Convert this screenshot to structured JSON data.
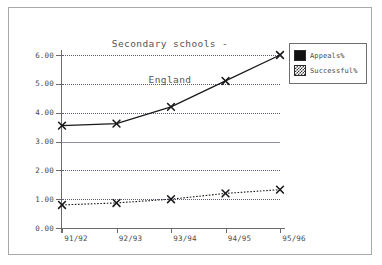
{
  "chart_data": {
    "type": "line",
    "title": "Secondary schools -\nEngland",
    "title_lines": [
      "Secondary schools -",
      "England"
    ],
    "xlabel": "",
    "ylabel": "",
    "categories": [
      "91/92",
      "92/93",
      "93/94",
      "94/95",
      "95/96"
    ],
    "series": [
      {
        "name": "Appeals%",
        "values": [
          3.55,
          3.62,
          4.2,
          5.1,
          6.0
        ],
        "marker": "x",
        "line_style": "solid",
        "color": "#1a1a1a"
      },
      {
        "name": "Successful%",
        "values": [
          0.8,
          0.87,
          1.0,
          1.2,
          1.33
        ],
        "marker": "x",
        "line_style": "dotted",
        "color": "#1a1a1a"
      }
    ],
    "ylim": [
      0.0,
      6.0
    ],
    "yticks": [
      0.0,
      1.0,
      2.0,
      3.0,
      4.0,
      5.0,
      6.0
    ],
    "ytick_labels": [
      "0.00",
      "1.00",
      "2.00",
      "3.00",
      "4.00",
      "5.00",
      "6.00"
    ],
    "grid": true,
    "grid_style": "dotted",
    "legend_position": "right-top",
    "legend_entries": [
      "Appeals%",
      "Successful%"
    ]
  },
  "legend": {
    "items": [
      {
        "label": "Appeals%",
        "swatch": "solid-black-swatch"
      },
      {
        "label": "Successful%",
        "swatch": "dotted-gray-swatch"
      }
    ]
  },
  "colors": {
    "background": "#ffffff",
    "frame": "#a8a8a8",
    "axis": "#6b6b6b",
    "grid": "#5b5b7a",
    "text": "#4a4a4a",
    "title_text": "#555555",
    "series_line": "#1a1a1a"
  }
}
